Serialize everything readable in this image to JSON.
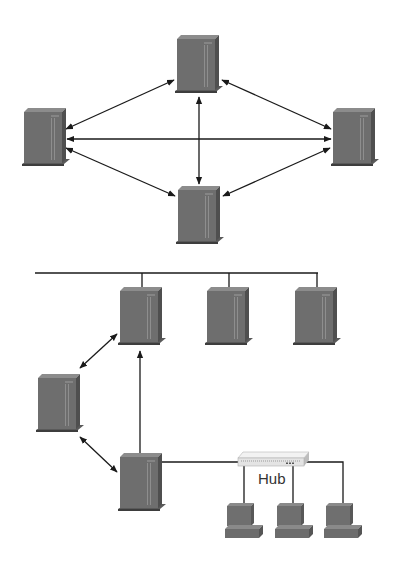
{
  "colors": {
    "background": "#ffffff",
    "server_front": "#6f6f6f",
    "server_side": "#525252",
    "server_top": "#8a8a8a",
    "server_base": "#5a5a5a",
    "server_stripe": "#8e8e8e",
    "line": "#1a1a1a",
    "hub_body": "#e8e8e8",
    "hub_top": "#f4f4f4",
    "pc_body": "#707070",
    "pc_side": "#555555"
  },
  "diagrams": [
    {
      "name": "mesh-network",
      "nodes": [
        {
          "id": "top",
          "type": "server",
          "x": 177,
          "y": 35
        },
        {
          "id": "left",
          "type": "server",
          "x": 25,
          "y": 108
        },
        {
          "id": "right",
          "type": "server",
          "x": 333,
          "y": 108
        },
        {
          "id": "bottom",
          "type": "server",
          "x": 178,
          "y": 186
        }
      ],
      "links": [
        {
          "from": "top",
          "to": "left",
          "arrows": "both"
        },
        {
          "from": "top",
          "to": "right",
          "arrows": "both"
        },
        {
          "from": "top",
          "to": "bottom",
          "arrows": "both"
        },
        {
          "from": "left",
          "to": "right",
          "arrows": "both"
        },
        {
          "from": "left",
          "to": "bottom",
          "arrows": "both"
        },
        {
          "from": "right",
          "to": "bottom",
          "arrows": "both"
        }
      ]
    },
    {
      "name": "hybrid-network",
      "nodes": [
        {
          "id": "bus-1",
          "type": "server",
          "x": 120,
          "y": 287
        },
        {
          "id": "bus-2",
          "type": "server",
          "x": 207,
          "y": 287
        },
        {
          "id": "bus-3",
          "type": "server",
          "x": 295,
          "y": 287
        },
        {
          "id": "middle-left",
          "type": "server",
          "x": 38,
          "y": 374
        },
        {
          "id": "gateway",
          "type": "server",
          "x": 120,
          "y": 453
        },
        {
          "id": "hub",
          "type": "hub",
          "label": "Hub",
          "x": 238,
          "y": 452
        },
        {
          "id": "pc-1",
          "type": "workstation",
          "x": 225,
          "y": 503
        },
        {
          "id": "pc-2",
          "type": "workstation",
          "x": 275,
          "y": 503
        },
        {
          "id": "pc-3",
          "type": "workstation",
          "x": 324,
          "y": 503
        }
      ],
      "links": [
        {
          "from": "bus",
          "to": "bus-1",
          "arrows": "none"
        },
        {
          "from": "bus",
          "to": "bus-2",
          "arrows": "none"
        },
        {
          "from": "bus",
          "to": "bus-3",
          "arrows": "none"
        },
        {
          "from": "middle-left",
          "to": "bus-1",
          "arrows": "both"
        },
        {
          "from": "middle-left",
          "to": "gateway",
          "arrows": "both"
        },
        {
          "from": "gateway",
          "to": "bus-1",
          "arrows": "end"
        },
        {
          "from": "gateway",
          "to": "hub",
          "arrows": "none"
        },
        {
          "from": "hub",
          "to": "pc-1",
          "arrows": "none"
        },
        {
          "from": "hub",
          "to": "pc-2",
          "arrows": "none"
        },
        {
          "from": "hub",
          "to": "pc-3",
          "arrows": "none"
        }
      ],
      "hub_label": "Hub"
    }
  ]
}
